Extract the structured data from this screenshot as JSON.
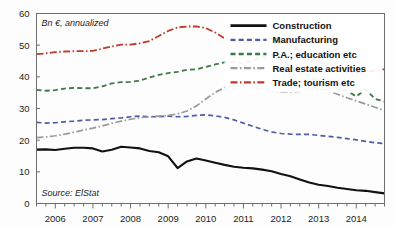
{
  "chart_data": {
    "type": "line",
    "title": "",
    "subtitle": "",
    "unit_label": "Bn €, annualized",
    "source": "Source: ElStat",
    "xlabel": "",
    "ylabel": "",
    "ylim": [
      0,
      60
    ],
    "yticks": [
      0,
      10,
      20,
      30,
      40,
      50,
      60
    ],
    "xlim": [
      2005.5,
      2014.75
    ],
    "xticks": [
      2006,
      2007,
      2008,
      2009,
      2010,
      2011,
      2012,
      2013,
      2014
    ],
    "xtick_labels": [
      "2006",
      "2007",
      "2008",
      "2009",
      "2010",
      "2011",
      "2012",
      "2013",
      "2014"
    ],
    "minor_x_ticks_per_year": 4,
    "grid": false,
    "legend_position": "top-right",
    "x": [
      2005.5,
      2005.75,
      2006.0,
      2006.25,
      2006.5,
      2006.75,
      2007.0,
      2007.25,
      2007.5,
      2007.75,
      2008.0,
      2008.25,
      2008.5,
      2008.75,
      2009.0,
      2009.25,
      2009.5,
      2009.75,
      2010.0,
      2010.25,
      2010.5,
      2010.75,
      2011.0,
      2011.25,
      2011.5,
      2011.75,
      2012.0,
      2012.25,
      2012.5,
      2012.75,
      2013.0,
      2013.25,
      2013.5,
      2013.75,
      2014.0,
      2014.25,
      2014.5,
      2014.75
    ],
    "series": [
      {
        "name": "Construction",
        "color": "#111111",
        "dash": "solid",
        "width": 2.1,
        "values": [
          17.0,
          17.1,
          16.9,
          17.3,
          17.6,
          17.6,
          17.4,
          16.4,
          17.0,
          17.9,
          17.7,
          17.4,
          16.6,
          16.2,
          14.9,
          11.2,
          13.3,
          14.2,
          13.6,
          12.9,
          12.2,
          11.6,
          11.3,
          11.1,
          10.7,
          10.2,
          9.3,
          8.6,
          7.6,
          6.6,
          5.9,
          5.5,
          5.0,
          4.6,
          4.2,
          4.0,
          3.6,
          3.2
        ]
      },
      {
        "name": "Manufacturing",
        "color": "#4b5fa8",
        "dash": "dashed",
        "width": 1.7,
        "values": [
          25.6,
          25.4,
          25.5,
          25.8,
          26.0,
          26.3,
          26.4,
          26.5,
          26.8,
          27.0,
          27.4,
          27.6,
          27.4,
          27.4,
          27.6,
          27.4,
          27.5,
          27.8,
          28.0,
          27.7,
          27.2,
          26.4,
          25.4,
          24.4,
          23.4,
          22.6,
          22.1,
          21.9,
          21.8,
          21.8,
          21.5,
          21.2,
          20.9,
          20.5,
          20.1,
          19.6,
          19.2,
          18.9
        ]
      },
      {
        "name": "P.A.; education etc",
        "color": "#3d7a46",
        "dash": "dashed",
        "width": 1.8,
        "values": [
          35.9,
          35.6,
          35.8,
          36.3,
          36.5,
          36.4,
          36.4,
          37.0,
          37.9,
          38.3,
          38.4,
          38.8,
          39.8,
          40.6,
          41.2,
          41.6,
          42.2,
          42.4,
          43.1,
          43.9,
          44.6,
          44.8,
          44.2,
          45.3,
          46.2,
          46.8,
          45.7,
          43.2,
          41.5,
          40.2,
          38.8,
          37.5,
          36.5,
          35.6,
          33.8,
          36.1,
          33.0,
          32.2
        ]
      },
      {
        "name": "Real estate activities",
        "color": "#9a9a9a",
        "dash": "dashdot",
        "width": 1.7,
        "values": [
          20.8,
          21.0,
          21.4,
          21.9,
          22.5,
          23.2,
          23.8,
          24.5,
          25.3,
          26.0,
          26.6,
          27.1,
          27.4,
          27.6,
          27.8,
          28.3,
          29.2,
          30.8,
          33.0,
          35.1,
          36.6,
          37.3,
          37.4,
          36.7,
          36.0,
          35.5,
          35.2,
          35.1,
          35.4,
          36.0,
          36.3,
          35.6,
          34.5,
          33.4,
          32.4,
          31.4,
          30.4,
          29.3
        ]
      },
      {
        "name": "Trade; tourism etc",
        "color": "#c0392b",
        "dash": "dashdot",
        "width": 1.8,
        "values": [
          47.2,
          47.4,
          47.8,
          48.0,
          48.1,
          48.1,
          48.2,
          48.9,
          49.6,
          50.2,
          50.2,
          50.6,
          51.3,
          52.9,
          54.5,
          55.6,
          55.9,
          55.9,
          55.4,
          54.0,
          52.1,
          51.0,
          50.7,
          51.0,
          51.6,
          52.1,
          51.7,
          50.0,
          48.0,
          46.3,
          44.8,
          43.5,
          42.4,
          41.6,
          41.3,
          41.6,
          42.0,
          42.4
        ]
      }
    ]
  },
  "legend": {
    "items": [
      {
        "label": "Construction"
      },
      {
        "label": "Manufacturing"
      },
      {
        "label": "P.A.; education etc"
      },
      {
        "label": "Real estate activities"
      },
      {
        "label": "Trade; tourism etc"
      }
    ]
  },
  "y_axis": {
    "labels": [
      "60",
      "50",
      "40",
      "30",
      "20",
      "10",
      "0"
    ]
  },
  "x_axis": {
    "labels": [
      "2006",
      "2007",
      "2008",
      "2009",
      "2010",
      "2011",
      "2012",
      "2013",
      "2014"
    ]
  },
  "annotations": {
    "unit": "Bn €, annualized",
    "source": "Source: ElStat"
  }
}
